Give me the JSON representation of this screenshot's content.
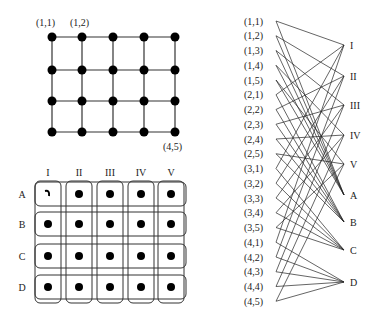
{
  "grid_graph": {
    "rows": 4,
    "cols": 5,
    "x": [
      52,
      82,
      113,
      144,
      175
    ],
    "y": [
      37,
      70,
      101,
      132
    ],
    "labels": [
      {
        "text": "(1,1)",
        "x": 36,
        "y": 26
      },
      {
        "text": "(1,2)",
        "x": 70,
        "y": 26
      },
      {
        "text": "(4,5)",
        "x": 163,
        "y": 150
      }
    ]
  },
  "cover_grid": {
    "col_labels": [
      "I",
      "II",
      "III",
      "IV",
      "V"
    ],
    "row_labels": [
      "A",
      "B",
      "C",
      "D"
    ],
    "x": [
      48,
      79,
      110,
      141,
      171
    ],
    "y": [
      194,
      224,
      256,
      287
    ],
    "missing": [
      [
        0,
        0
      ]
    ]
  },
  "bipartite": {
    "left_labels": [
      "(1,1)",
      "(1,2)",
      "(1,3)",
      "(1,4)",
      "(1,5)",
      "(2,1)",
      "(2,2)",
      "(2,3)",
      "(2,4)",
      "(2,5)",
      "(3,1)",
      "(3,2)",
      "(3,3)",
      "(3,4)",
      "(3,5)",
      "(4,1)",
      "(4,2)",
      "(4,3)",
      "(4,4)",
      "(4,5)"
    ],
    "left_x": 276,
    "left_y0": 21,
    "left_dy": 14.75,
    "right_nodes": [
      {
        "label": "I",
        "y": 45
      },
      {
        "label": "II",
        "y": 76
      },
      {
        "label": "III",
        "y": 105
      },
      {
        "label": "IV",
        "y": 135
      },
      {
        "label": "V",
        "y": 164
      },
      {
        "label": "A",
        "y": 195
      },
      {
        "label": "B",
        "y": 222
      },
      {
        "label": "C",
        "y": 250
      },
      {
        "label": "D",
        "y": 282
      }
    ],
    "right_x": 344
  }
}
